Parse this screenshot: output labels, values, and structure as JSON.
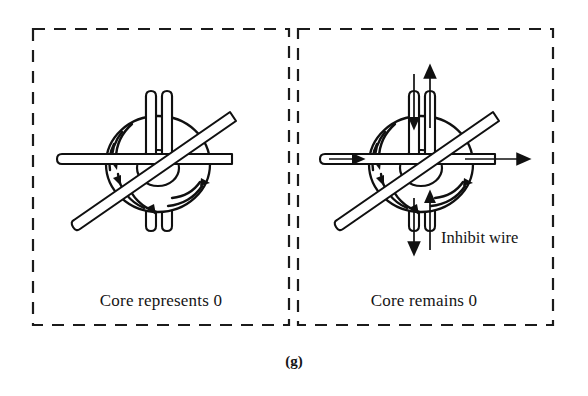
{
  "figure": {
    "caption": "(g)",
    "panels": [
      {
        "id": "left-panel",
        "caption": "Core represents 0",
        "wires": [
          {
            "name": "vertical-wire-pair",
            "count": 2,
            "arrows": []
          },
          {
            "name": "horizontal-wire",
            "arrows": []
          },
          {
            "name": "diagonal-wire",
            "arrows": []
          }
        ],
        "flux_arrows": 4,
        "annotations": []
      },
      {
        "id": "right-panel",
        "caption": "Core remains 0",
        "annotation_label": "Inhibit wire",
        "wires": [
          {
            "name": "inhibit-wire-left",
            "current_direction": "down"
          },
          {
            "name": "inhibit-wire-right",
            "current_direction": "up"
          },
          {
            "name": "horizontal-wire",
            "current_direction": "right"
          },
          {
            "name": "diagonal-wire",
            "current_direction": "none"
          }
        ],
        "flux_arrows": 4,
        "annotations": [
          "Inhibit wire"
        ]
      }
    ]
  },
  "colors": {
    "ink": "#101010",
    "border": "#1b1b1b",
    "background": "#ffffff"
  }
}
